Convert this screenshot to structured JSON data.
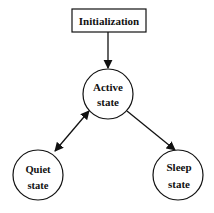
{
  "diagram": {
    "type": "state-diagram",
    "nodes": {
      "init": {
        "label": "Initialization",
        "shape": "rectangle"
      },
      "active": {
        "line1": "Active",
        "line2": "state",
        "shape": "circle"
      },
      "quiet": {
        "line1": "Quiet",
        "line2": "state",
        "shape": "circle"
      },
      "sleep": {
        "line1": "Sleep",
        "line2": "state",
        "shape": "circle"
      }
    },
    "edges": [
      {
        "from": "Initialization",
        "to": "Active state",
        "direction": "one-way"
      },
      {
        "from": "Active state",
        "to": "Quiet state",
        "direction": "two-way"
      },
      {
        "from": "Active state",
        "to": "Sleep state",
        "direction": "one-way"
      }
    ],
    "colors": {
      "stroke": "#111111",
      "background": "#ffffff"
    }
  }
}
